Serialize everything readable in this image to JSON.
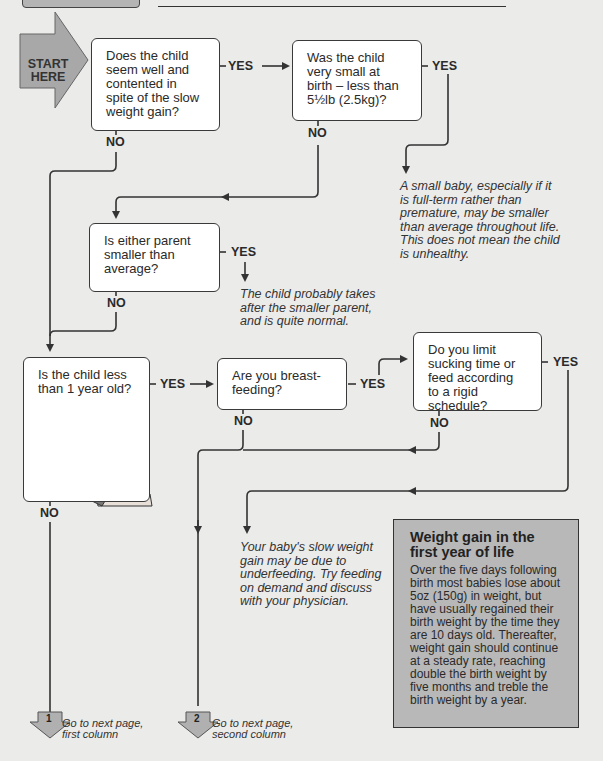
{
  "header": {
    "tab_label": "",
    "title": ""
  },
  "start": {
    "label_line1": "START",
    "label_line2": "HERE",
    "color": "#a8a8a8"
  },
  "questions": {
    "q1": {
      "text": "Does the child seem well and contented in spite of the slow weight gain?",
      "yes": "YES",
      "no": "NO"
    },
    "q2": {
      "text": "Was the child very small at birth – less than 5½lb (2.5kg)?",
      "yes": "YES",
      "no": "NO"
    },
    "q3": {
      "text": "Is either parent smaller than average?",
      "yes": "YES",
      "no": "NO"
    },
    "q4": {
      "text": "Is the child less than 1 year old?",
      "yes": "YES",
      "no": "NO"
    },
    "q5": {
      "text": "Are you breast-feeding?",
      "yes": "YES",
      "no": "NO"
    },
    "q6": {
      "text": "Do you limit sucking time or feed according to a rigid schedule?",
      "yes": "YES",
      "no": "NO"
    }
  },
  "outcomes": {
    "small_baby": "A small baby, especially if it is full-term rather than premature, may be smaller than average throughout life. This does not mean the child is unhealthy.",
    "smaller_parent": "The child probably takes after the smaller parent, and is quite normal.",
    "underfeeding": "Your baby's slow weight gain may be due to underfeeding. Try feeding on demand and discuss with your physician."
  },
  "info_box": {
    "title": "Weight gain in the first year of life",
    "body": "Over the five days following birth most babies lose about 5oz (150g) in weight, but have usually regained their birth weight by the time they are 10 days old. Thereafter, weight gain should continue at a steady rate, reaching double the birth weight by five months and treble the birth weight by a year.",
    "background": "#b8b8b8"
  },
  "goto": [
    {
      "number": "1",
      "line1": "Go to next page,",
      "line2": "first column"
    },
    {
      "number": "2",
      "line1": "Go to next page,",
      "line2": "second column"
    }
  ],
  "illustration": {
    "name": "seated-baby"
  }
}
